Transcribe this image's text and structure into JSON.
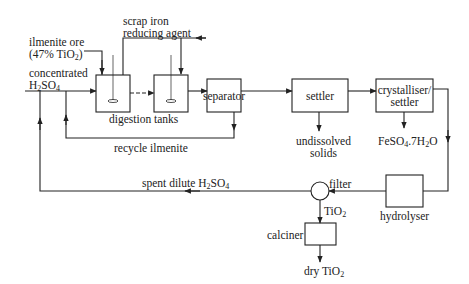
{
  "diagram": {
    "inputs": {
      "ilmenite_ore": [
        "ilmenite ore",
        "(47% TiO",
        "2",
        ")"
      ],
      "scrap_iron": [
        "scrap iron",
        "reducing agent"
      ],
      "acid": [
        "concentrated",
        "H",
        "2",
        "SO",
        "4"
      ]
    },
    "units": {
      "digestion_tanks": "digestion tanks",
      "separator": "separator",
      "settler": "settler",
      "crystalliser": [
        "crystalliser/",
        "settler"
      ],
      "hydrolyser": "hydrolyser",
      "filter": "filter",
      "calciner": "calciner"
    },
    "streams": {
      "recycle_ilmenite": "recycle ilmenite",
      "undissolved_solids": [
        "undissolved",
        "solids"
      ],
      "ferrous_sulfate": [
        "FeSO",
        "4",
        ".7H",
        "2",
        "O"
      ],
      "spent_acid": [
        "spent dilute H",
        "2",
        "SO",
        "4"
      ],
      "tio2": [
        "TiO",
        "2"
      ],
      "dry_tio2": [
        "dry TiO",
        "2"
      ]
    },
    "colors": {
      "line": "#222222",
      "background": "#ffffff"
    }
  }
}
